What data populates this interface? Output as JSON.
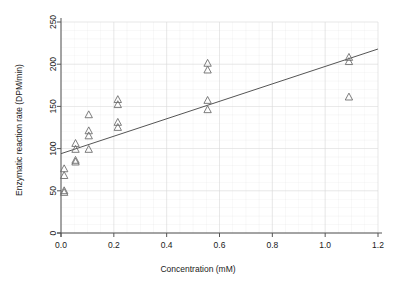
{
  "chart_data": {
    "type": "scatter",
    "title": "",
    "xlabel": "Concentration (mM)",
    "ylabel": "Enzymatic reaction rate (DPM/min)",
    "xlim": [
      0.0,
      1.2
    ],
    "ylim": [
      0,
      250
    ],
    "xticks": [
      "0.0",
      "0.2",
      "0.4",
      "0.6",
      "0.8",
      "1.0",
      "1.2"
    ],
    "xtick_values": [
      0.0,
      0.2,
      0.4,
      0.6,
      0.8,
      1.0,
      1.2
    ],
    "yticks": [
      "0",
      "50",
      "100",
      "150",
      "200",
      "250"
    ],
    "ytick_values": [
      0,
      50,
      100,
      150,
      200,
      250
    ],
    "grid": true,
    "grid_color": "#d9d9d9",
    "marker": "open-triangle",
    "marker_color": "#6e6e6e",
    "line_color": "#555555",
    "legend": "none",
    "points": [
      {
        "x": 0.012,
        "y": 48
      },
      {
        "x": 0.012,
        "y": 50
      },
      {
        "x": 0.012,
        "y": 68
      },
      {
        "x": 0.012,
        "y": 76
      },
      {
        "x": 0.055,
        "y": 84
      },
      {
        "x": 0.055,
        "y": 86
      },
      {
        "x": 0.055,
        "y": 99
      },
      {
        "x": 0.055,
        "y": 106
      },
      {
        "x": 0.105,
        "y": 99
      },
      {
        "x": 0.105,
        "y": 115
      },
      {
        "x": 0.105,
        "y": 121
      },
      {
        "x": 0.105,
        "y": 140
      },
      {
        "x": 0.215,
        "y": 125
      },
      {
        "x": 0.215,
        "y": 131
      },
      {
        "x": 0.215,
        "y": 152
      },
      {
        "x": 0.215,
        "y": 158
      },
      {
        "x": 0.555,
        "y": 146
      },
      {
        "x": 0.555,
        "y": 157
      },
      {
        "x": 0.555,
        "y": 193
      },
      {
        "x": 0.555,
        "y": 201
      },
      {
        "x": 1.09,
        "y": 161
      },
      {
        "x": 1.09,
        "y": 203
      },
      {
        "x": 1.09,
        "y": 208
      }
    ],
    "fit_line": {
      "type": "linear-regression",
      "x_start": 0.0,
      "y_start": 94,
      "x_end": 1.2,
      "y_end": 218
    }
  },
  "caption": {
    "text": ""
  }
}
